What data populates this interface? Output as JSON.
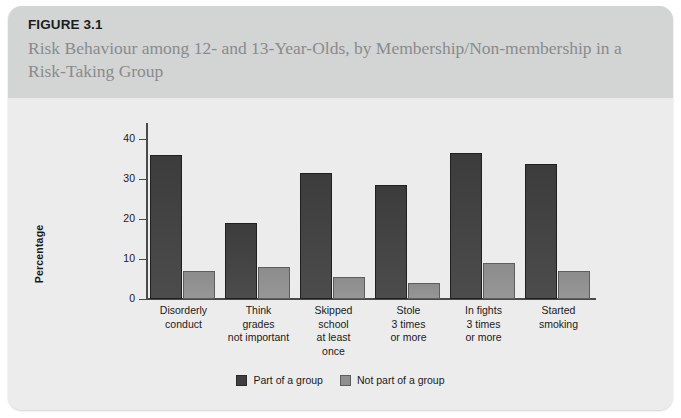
{
  "figure": {
    "number": "FIGURE 3.1",
    "title": "Risk Behaviour among 12- and 13-Year-Olds, by Membership/Non-membership in a Risk-Taking Group"
  },
  "colors": {
    "series_dark": "#3f3f3f",
    "series_light": "#8f8f8f",
    "header_band": "#d3d4d4",
    "panel": "#ececec"
  },
  "chart_data": {
    "type": "bar",
    "title": "Risk Behaviour among 12- and 13-Year-Olds, by Membership/Non-membership in a Risk-Taking Group",
    "xlabel": "",
    "ylabel": "Percentage",
    "ylim": [
      0,
      44
    ],
    "yticks": [
      0,
      10,
      20,
      30,
      40
    ],
    "ytick_labels": [
      "0",
      "10",
      "20",
      "30",
      "40"
    ],
    "grid": false,
    "legend_position": "bottom-center",
    "categories": [
      "Disorderly conduct",
      "Think grades not important",
      "Skipped school at least once",
      "Stole 3 times or more",
      "In fights 3 times or more",
      "Started smoking"
    ],
    "category_lines": [
      [
        "Disorderly",
        "conduct"
      ],
      [
        "Think",
        "grades",
        "not important"
      ],
      [
        "Skipped",
        "school",
        "at least",
        "once"
      ],
      [
        "Stole",
        "3 times",
        "or more"
      ],
      [
        "In fights",
        "3 times",
        "or more"
      ],
      [
        "Started",
        "smoking"
      ]
    ],
    "series": [
      {
        "name": "Part of a group",
        "color": "#3f3f3f",
        "values": [
          36,
          19,
          31.5,
          28.5,
          36.5,
          33.8
        ]
      },
      {
        "name": "Not part of a group",
        "color": "#8f8f8f",
        "values": [
          7,
          8,
          5.5,
          4,
          9,
          7
        ]
      }
    ]
  },
  "legend": {
    "items": [
      {
        "label": "Part of a group",
        "swatch": "dark"
      },
      {
        "label": "Not part of a group",
        "swatch": "light"
      }
    ]
  }
}
